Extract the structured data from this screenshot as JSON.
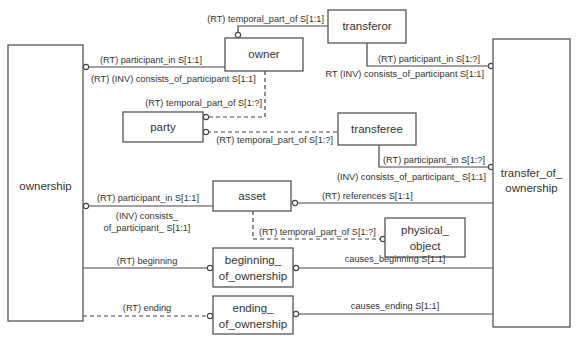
{
  "entities": {
    "ownership": "ownership",
    "transfer_of_ownership_1": "transfer_of_",
    "transfer_of_ownership_2": "ownership",
    "owner": "owner",
    "transferor": "transferor",
    "party": "party",
    "transferee": "transferee",
    "asset": "asset",
    "physical_object_1": "physical_",
    "physical_object_2": "object",
    "beginning_of_ownership_1": "beginning_",
    "beginning_of_ownership_2": "of_ownership",
    "ending_of_ownership_1": "ending_",
    "ending_of_ownership_2": "of_ownership"
  },
  "relations": {
    "owner_temporal_part_of": "(RT) temporal_part_of S[1:1]",
    "owner_participant_in": "(RT) participant_in S[1:1]",
    "owner_consists_of_participant": "(RT) (INV) consists_of_participant S[1:1]",
    "owner_party_temporal_part_of": "(RT) temporal_part_of S[1:?]",
    "transferor_participant_in": "(RT) participant_in S[1:?]",
    "transferor_consists_of_participant": "RT (INV) consists_of_participant S[1:1]",
    "transferee_temporal_part_of": "(RT) temporal_part_of S[1:?]",
    "transferee_participant_in": "(RT) participant_in S[1:?]",
    "transferee_consists_of_participant": "(INV) consists_of_participant_ S[1:1]",
    "asset_participant_in": "(RT) participant_in S[1:1]",
    "asset_consists_of_participant_1": "(INV) consists_",
    "asset_consists_of_participant_2": "of_participant_ S[1:1]",
    "asset_references": "(RT) references S[1:1]",
    "asset_temporal_part_of": "(RT) temporal_part_of S[1:?]",
    "beginning": "(RT) beginning",
    "causes_beginning": "causes_beginning S[1:1]",
    "ending": "(RT) ending",
    "causes_ending": "causes_ending S[1:1]"
  }
}
